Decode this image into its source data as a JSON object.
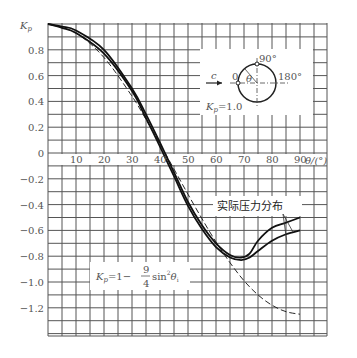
{
  "chart_data": {
    "type": "line",
    "title": "",
    "xlabel": "θ/(°)",
    "ylabel": "Kp",
    "xlim": [
      0,
      100
    ],
    "ylim": [
      -1.42,
      1.0
    ],
    "grid": true,
    "x_ticks": [
      "10",
      "20",
      "30",
      "40",
      "50",
      "60",
      "70",
      "80",
      "90"
    ],
    "y_ticks": [
      "0.8",
      "0.6",
      "0.4",
      "0.2",
      "0",
      "-0.2",
      "-0.4",
      "-0.6",
      "-0.8",
      "-1.0",
      "-1.2"
    ],
    "series": [
      {
        "name": "Kp = 1 - 9/4 sin²θ (theoretical)",
        "style": "dashed",
        "x": [
          0,
          10,
          20,
          30,
          35,
          40,
          45,
          50,
          55,
          60,
          65,
          70,
          75,
          80,
          85,
          90
        ],
        "y": [
          1.0,
          0.93,
          0.74,
          0.44,
          0.26,
          0.07,
          -0.125,
          -0.32,
          -0.51,
          -0.69,
          -0.85,
          -0.99,
          -1.1,
          -1.18,
          -1.23,
          -1.25
        ]
      },
      {
        "name": "实际压力分布 (upper)",
        "style": "solid",
        "x": [
          0,
          5,
          10,
          20,
          30,
          35,
          40,
          45,
          50,
          55,
          60,
          65,
          69,
          72,
          75,
          80,
          85,
          90
        ],
        "y": [
          1.0,
          0.98,
          0.95,
          0.8,
          0.5,
          0.3,
          0.08,
          -0.15,
          -0.38,
          -0.56,
          -0.7,
          -0.79,
          -0.81,
          -0.78,
          -0.68,
          -0.58,
          -0.54,
          -0.5
        ]
      },
      {
        "name": "实际压力分布 (lower)",
        "style": "solid",
        "x": [
          0,
          5,
          10,
          20,
          30,
          35,
          40,
          45,
          50,
          55,
          60,
          65,
          69,
          72,
          75,
          80,
          85,
          90
        ],
        "y": [
          1.0,
          0.97,
          0.93,
          0.77,
          0.48,
          0.27,
          0.05,
          -0.18,
          -0.41,
          -0.59,
          -0.73,
          -0.81,
          -0.83,
          -0.81,
          -0.76,
          -0.68,
          -0.63,
          -0.6
        ]
      }
    ],
    "annotations": [
      {
        "text": "实际压力分布",
        "target": "both solid curves"
      },
      {
        "text": "Kp = 1 - (9/4) sin²θ",
        "target": "dashed curve"
      },
      {
        "text": "Kp = 1.0",
        "context": "inset: cylinder with stagnation point at 0"
      }
    ]
  },
  "axis": {
    "y_label_main": "K",
    "y_label_sub": "p",
    "x_label": "θ/(°)",
    "x_ticks": [
      "10",
      "20",
      "30",
      "40",
      "50",
      "60",
      "70",
      "80",
      "90"
    ],
    "y_ticks": [
      "0.8",
      "0.6",
      "0.4",
      "0.2",
      "0",
      "−0.2",
      "−0.4",
      "−0.6",
      "−0.8",
      "−1.0",
      "−1.2"
    ]
  },
  "inset": {
    "flow_label": "c",
    "zero_label": "0",
    "ninety_label": "90°",
    "oneeighty_label": "180°",
    "theta_label": "θ",
    "kp_label_main": "K",
    "kp_label_sub": "p",
    "kp_value": "=1.0"
  },
  "legend": {
    "actual_label": "实际压力分布"
  },
  "formula": {
    "lhs_main": "K",
    "lhs_sub": "p",
    "eq": "=1−",
    "num": "9",
    "den": "4",
    "sin": "sin",
    "sq": "2",
    "theta": "θ",
    "theta_sub": "i"
  }
}
